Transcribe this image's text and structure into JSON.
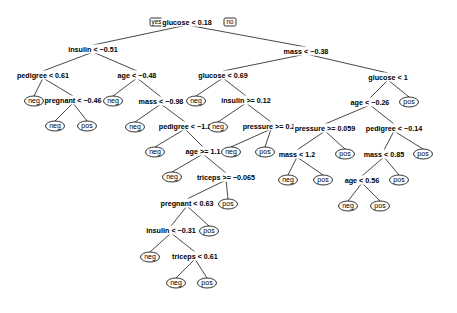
{
  "diagram": {
    "type": "decision-tree",
    "branch_labels": {
      "yes": "yes",
      "no": "no"
    },
    "splits": [
      {
        "id": "n1",
        "label": "glucose < 0.18",
        "x": 187,
        "y": 22
      },
      {
        "id": "n2",
        "label": "insulin < −0.51",
        "x": 93,
        "y": 49
      },
      {
        "id": "n3",
        "label": "mass < −0.38",
        "x": 306,
        "y": 51
      },
      {
        "id": "n4",
        "label": "pedigree < 0.61",
        "x": 43,
        "y": 75
      },
      {
        "id": "n5",
        "label": "age < −0.48",
        "x": 137,
        "y": 75
      },
      {
        "id": "n6",
        "label": "pregnant < −0.46",
        "x": 73,
        "y": 100
      },
      {
        "id": "n7",
        "label": "mass < −0.98",
        "x": 161,
        "y": 101
      },
      {
        "id": "n8",
        "label": "pedigree < −1.2",
        "x": 185,
        "y": 126
      },
      {
        "id": "n9",
        "label": "age >= 1.1",
        "x": 203,
        "y": 151
      },
      {
        "id": "n10",
        "label": "triceps >= −0.065",
        "x": 226,
        "y": 177
      },
      {
        "id": "n11",
        "label": "pregnant < 0.63",
        "x": 187,
        "y": 203
      },
      {
        "id": "n12",
        "label": "insulin < −0.31",
        "x": 171,
        "y": 230
      },
      {
        "id": "n13",
        "label": "triceps < 0.61",
        "x": 195,
        "y": 256
      },
      {
        "id": "n14",
        "label": "glucose < 0.69",
        "x": 223,
        "y": 75
      },
      {
        "id": "n15",
        "label": "insulin >= 0.12",
        "x": 246,
        "y": 100
      },
      {
        "id": "n16",
        "label": "pressure >= 0.21",
        "x": 271,
        "y": 126
      },
      {
        "id": "n17",
        "label": "glucose < 1",
        "x": 388,
        "y": 77
      },
      {
        "id": "n18",
        "label": "age < −0.26",
        "x": 370,
        "y": 102
      },
      {
        "id": "n19",
        "label": "pressure >= 0.059",
        "x": 325,
        "y": 128
      },
      {
        "id": "n20",
        "label": "pedigree < −0.14",
        "x": 394,
        "y": 128
      },
      {
        "id": "n21",
        "label": "mass < 1.2",
        "x": 297,
        "y": 154
      },
      {
        "id": "n22",
        "label": "mass < 0.85",
        "x": 384,
        "y": 154
      },
      {
        "id": "n23",
        "label": "age < 0.56",
        "x": 362,
        "y": 180
      }
    ],
    "leaves": [
      {
        "id": "l1",
        "label": "neg",
        "x": 34,
        "y": 101
      },
      {
        "id": "l2",
        "label": "neg",
        "x": 55,
        "y": 126
      },
      {
        "id": "l3",
        "label": "pos",
        "x": 87,
        "y": 126
      },
      {
        "id": "l4",
        "label": "neg",
        "x": 113,
        "y": 101
      },
      {
        "id": "l5",
        "label": "neg",
        "x": 135,
        "y": 127
      },
      {
        "id": "l6",
        "label": "neg",
        "x": 155,
        "y": 152
      },
      {
        "id": "l7",
        "label": "neg",
        "x": 172,
        "y": 177
      },
      {
        "id": "l8",
        "label": "pos",
        "x": 228,
        "y": 204
      },
      {
        "id": "l9",
        "label": "pos",
        "x": 209,
        "y": 231
      },
      {
        "id": "l10",
        "label": "neg",
        "x": 150,
        "y": 257
      },
      {
        "id": "l11",
        "label": "neg",
        "x": 176,
        "y": 283
      },
      {
        "id": "l12",
        "label": "pos",
        "x": 207,
        "y": 283
      },
      {
        "id": "l13",
        "label": "neg",
        "x": 196,
        "y": 101
      },
      {
        "id": "l14",
        "label": "neg",
        "x": 218,
        "y": 127
      },
      {
        "id": "l15",
        "label": "neg",
        "x": 231,
        "y": 152
      },
      {
        "id": "l16",
        "label": "pos",
        "x": 265,
        "y": 152
      },
      {
        "id": "l17",
        "label": "pos",
        "x": 409,
        "y": 102
      },
      {
        "id": "l18",
        "label": "pos",
        "x": 345,
        "y": 154
      },
      {
        "id": "l19",
        "label": "pos",
        "x": 423,
        "y": 154
      },
      {
        "id": "l20",
        "label": "neg",
        "x": 288,
        "y": 180
      },
      {
        "id": "l21",
        "label": "pos",
        "x": 323,
        "y": 180
      },
      {
        "id": "l22",
        "label": "pos",
        "x": 399,
        "y": 180
      },
      {
        "id": "l23",
        "label": "neg",
        "x": 348,
        "y": 206
      },
      {
        "id": "l24",
        "label": "pos",
        "x": 380,
        "y": 206
      }
    ],
    "edges": [
      [
        "n1",
        "n2"
      ],
      [
        "n1",
        "n3"
      ],
      [
        "n2",
        "n4"
      ],
      [
        "n2",
        "n5"
      ],
      [
        "n4",
        "l1"
      ],
      [
        "n4",
        "n6"
      ],
      [
        "n6",
        "l2"
      ],
      [
        "n6",
        "l3"
      ],
      [
        "n5",
        "l4"
      ],
      [
        "n5",
        "n7"
      ],
      [
        "n7",
        "l5"
      ],
      [
        "n7",
        "n8"
      ],
      [
        "n8",
        "l6"
      ],
      [
        "n8",
        "n9"
      ],
      [
        "n9",
        "l7"
      ],
      [
        "n9",
        "n10"
      ],
      [
        "n10",
        "n11"
      ],
      [
        "n10",
        "l8"
      ],
      [
        "n11",
        "n12"
      ],
      [
        "n11",
        "l9"
      ],
      [
        "n12",
        "l10"
      ],
      [
        "n12",
        "n13"
      ],
      [
        "n13",
        "l11"
      ],
      [
        "n13",
        "l12"
      ],
      [
        "n3",
        "n14"
      ],
      [
        "n3",
        "n17"
      ],
      [
        "n14",
        "l13"
      ],
      [
        "n14",
        "n15"
      ],
      [
        "n15",
        "l14"
      ],
      [
        "n15",
        "n16"
      ],
      [
        "n16",
        "l15"
      ],
      [
        "n16",
        "l16"
      ],
      [
        "n17",
        "n18"
      ],
      [
        "n17",
        "l17"
      ],
      [
        "n18",
        "n19"
      ],
      [
        "n18",
        "n20"
      ],
      [
        "n19",
        "n21"
      ],
      [
        "n19",
        "l18"
      ],
      [
        "n21",
        "l20"
      ],
      [
        "n21",
        "l21"
      ],
      [
        "n20",
        "n22"
      ],
      [
        "n20",
        "l19"
      ],
      [
        "n22",
        "n23"
      ],
      [
        "n22",
        "l22"
      ],
      [
        "n23",
        "l23"
      ],
      [
        "n23",
        "l24"
      ]
    ]
  }
}
